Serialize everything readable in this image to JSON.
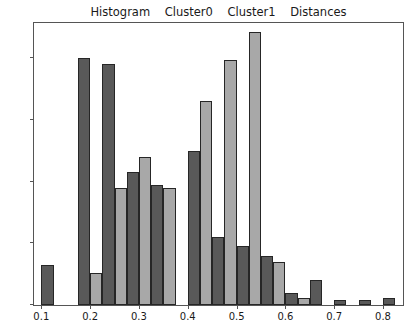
{
  "title": {
    "text": "Histogram    Cluster0    Cluster1    Distances",
    "parts": [
      "Histogram",
      "Cluster0",
      "Cluster1",
      "Distances"
    ]
  },
  "colors": {
    "cluster0": "#595959",
    "cluster1": "#a8a8a8",
    "edge": "#262626",
    "axis": "#555555",
    "text": "#1a1a1a",
    "background": "#ffffff"
  },
  "axis": {
    "y_ticks": [
      "0",
      "10",
      "20",
      "30",
      "40"
    ],
    "y_tick_values": [
      0,
      10,
      20,
      30,
      40
    ],
    "x_ticks": [
      "0.1",
      "0.2",
      "0.3",
      "0.4",
      "0.5",
      "0.6",
      "0.7",
      "0.8"
    ],
    "x_tick_values": [
      0.1,
      0.2,
      0.3,
      0.4,
      0.5,
      0.6,
      0.7,
      0.8
    ]
  },
  "chart_data": {
    "type": "bar",
    "title": "Histogram    Cluster0    Cluster1    Distances",
    "xlabel": "Distances",
    "ylabel": "",
    "xlim": [
      0.085,
      0.845
    ],
    "ylim": [
      0,
      46
    ],
    "grid": false,
    "legend": null,
    "bin_width": 0.025,
    "categories": [
      0.1125,
      0.1875,
      0.2125,
      0.2375,
      0.2625,
      0.2875,
      0.3125,
      0.3375,
      0.3625,
      0.4125,
      0.4375,
      0.4625,
      0.4875,
      0.5125,
      0.5375,
      0.5625,
      0.5875,
      0.6125,
      0.6625,
      0.7125,
      0.7625,
      0.8125
    ],
    "series": [
      {
        "name": "Cluster0",
        "color": "#595959",
        "bars": [
          {
            "x": 0.1125,
            "value": 6.5
          },
          {
            "x": 0.1875,
            "value": 40.0
          },
          {
            "x": 0.2375,
            "value": 39.0
          },
          {
            "x": 0.2875,
            "value": 21.5
          },
          {
            "x": 0.3375,
            "value": 19.5
          },
          {
            "x": 0.4125,
            "value": 25.0
          },
          {
            "x": 0.4625,
            "value": 11.0
          },
          {
            "x": 0.5125,
            "value": 9.5
          },
          {
            "x": 0.5625,
            "value": 8.0
          },
          {
            "x": 0.6125,
            "value": 2.0
          },
          {
            "x": 0.6625,
            "value": 4.0
          },
          {
            "x": 0.7125,
            "value": 0.8
          },
          {
            "x": 0.7625,
            "value": 0.8
          },
          {
            "x": 0.8125,
            "value": 1.2
          }
        ]
      },
      {
        "name": "Cluster1",
        "color": "#a8a8a8",
        "bars": [
          {
            "x": 0.2125,
            "value": 5.2
          },
          {
            "x": 0.2625,
            "value": 19.0
          },
          {
            "x": 0.3125,
            "value": 24.0
          },
          {
            "x": 0.3625,
            "value": 19.0
          },
          {
            "x": 0.4375,
            "value": 33.0
          },
          {
            "x": 0.4875,
            "value": 39.7
          },
          {
            "x": 0.5375,
            "value": 44.2
          },
          {
            "x": 0.5875,
            "value": 7.0
          },
          {
            "x": 0.6375,
            "value": 1.2
          }
        ]
      }
    ]
  }
}
